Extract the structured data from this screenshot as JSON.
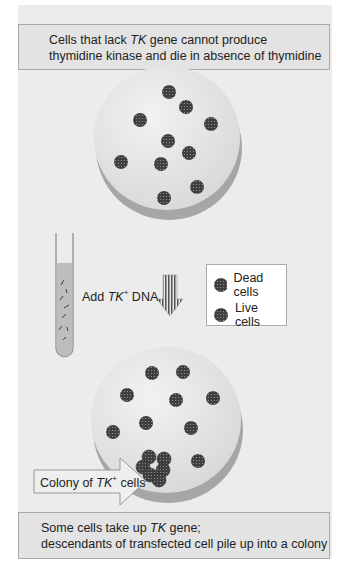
{
  "top_box": {
    "line1_pre": "Cells that lack ",
    "line1_gene": "TK",
    "line1_post": " gene cannot produce",
    "line2": "thymidine kinase and die in absence of thymidine"
  },
  "step": {
    "add_label_pre": "Add ",
    "add_label_gene": "TK",
    "add_label_sup": "+",
    "add_label_post": " DNA"
  },
  "legend": {
    "items": [
      {
        "label": "Dead cells",
        "color": "#555555"
      },
      {
        "label": "Live cells",
        "color": "#444444"
      }
    ]
  },
  "callout": {
    "pre": "Colony of ",
    "gene": "TK",
    "sup": "+",
    "post": " cells"
  },
  "bottom_box": {
    "line1_pre": "Some cells take up ",
    "line1_gene": "TK",
    "line1_post": " gene;",
    "line2": "descendants of transfected cell pile up into a colony"
  },
  "colors": {
    "background": "#ececec",
    "dish_top": "#e6e6e6",
    "dish_side": "#a8a8a8",
    "cell": "#4a4a4a",
    "tube_liquid": "#bdbdbd"
  }
}
